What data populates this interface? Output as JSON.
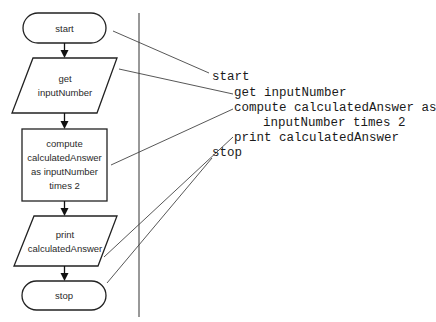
{
  "flowchart": {
    "nodes": [
      {
        "id": "start",
        "type": "terminal",
        "lines": [
          "start"
        ]
      },
      {
        "id": "get-input",
        "type": "input-output",
        "lines": [
          "get",
          "inputNumber"
        ]
      },
      {
        "id": "compute",
        "type": "process",
        "lines": [
          "compute",
          "calculatedAnswer",
          "as inputNumber",
          "times 2"
        ]
      },
      {
        "id": "print",
        "type": "input-output",
        "lines": [
          "print",
          "calculatedAnswer"
        ]
      },
      {
        "id": "stop",
        "type": "terminal",
        "lines": [
          "stop"
        ]
      }
    ]
  },
  "pseudocode": {
    "lines": [
      "start",
      "get inputNumber",
      "compute calculatedAnswer as",
      "inputNumber times 2",
      "print calculatedAnswer",
      "stop"
    ]
  },
  "colors": {
    "stroke": "#222222",
    "connector": "#444444",
    "background": "#ffffff"
  }
}
